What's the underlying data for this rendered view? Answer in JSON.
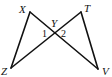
{
  "diagram": {
    "type": "geometry",
    "stroke_color": "#111111",
    "background": "#ffffff",
    "vertices": {
      "X": {
        "label": "X",
        "x": 30,
        "y": 12
      },
      "T": {
        "label": "T",
        "x": 81,
        "y": 12
      },
      "Y": {
        "label": "Y",
        "x": 54,
        "y": 33
      },
      "Z": {
        "label": "Z",
        "x": 11,
        "y": 68
      },
      "V": {
        "label": "V",
        "x": 98,
        "y": 69
      }
    },
    "segments": [
      {
        "from": "X",
        "to": "Z"
      },
      {
        "from": "X",
        "to": "V"
      },
      {
        "from": "T",
        "to": "Z"
      },
      {
        "from": "T",
        "to": "V"
      }
    ],
    "angles": [
      {
        "label": "1",
        "at": "Y",
        "side": "left"
      },
      {
        "label": "2",
        "at": "Y",
        "side": "right"
      }
    ]
  }
}
